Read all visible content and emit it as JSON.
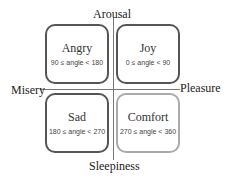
{
  "axes": {
    "top": "Arousal",
    "bottom": "Sleepiness",
    "left": "Misery",
    "right": "Pleasure"
  },
  "quadrants": [
    {
      "name": "Angry",
      "range": "90 ≤ angle < 180"
    },
    {
      "name": "Joy",
      "range": "0 ≤ angle < 90"
    },
    {
      "name": "Sad",
      "range": "180 ≤ angle < 270"
    },
    {
      "name": "Comfort",
      "range": "270 ≤ angle < 360"
    }
  ]
}
